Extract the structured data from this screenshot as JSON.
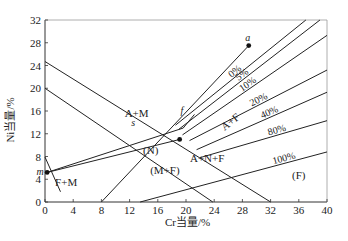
{
  "chart_data": {
    "type": "diagram",
    "title": "",
    "xlabel": "Cr当量/%",
    "ylabel": "Ni当量/%",
    "xlim": [
      0,
      40
    ],
    "ylim": [
      0,
      32
    ],
    "x_ticks": [
      "0",
      "4",
      "8",
      "12",
      "16",
      "20",
      "24",
      "28",
      "32",
      "36",
      "40"
    ],
    "y_ticks": [
      "0",
      "4",
      "8",
      "12",
      "16",
      "20",
      "24",
      "28",
      "32"
    ],
    "grid": false,
    "regions": [
      {
        "label": "A+M",
        "x": 13,
        "y": 15
      },
      {
        "label": "A",
        "x": 20.6,
        "y": 13.6
      },
      {
        "label": "A+F",
        "x": 26.6,
        "y": 13.6
      },
      {
        "label": "(N)",
        "x": 15,
        "y": 8.5
      },
      {
        "label": "(M+F)",
        "x": 17,
        "y": 5
      },
      {
        "label": "A+N+F",
        "x": 23,
        "y": 7
      },
      {
        "label": "F+M",
        "x": 3,
        "y": 2.8
      },
      {
        "label": "(F)",
        "x": 36,
        "y": 4
      }
    ],
    "ferrite_lines": [
      {
        "label": "0%",
        "from": [
          18.5,
          13.5
        ],
        "to": [
          37,
          32
        ]
      },
      {
        "label": "5%",
        "from": [
          19,
          12.8
        ],
        "to": [
          39,
          32
        ]
      },
      {
        "label": "10%",
        "from": [
          19.5,
          11.8
        ],
        "to": [
          40,
          29.3
        ]
      },
      {
        "label": "20%",
        "from": [
          20.5,
          10.8
        ],
        "to": [
          40,
          23.2
        ]
      },
      {
        "label": "40%",
        "from": [
          21.5,
          9.2
        ],
        "to": [
          40,
          19.3
        ]
      },
      {
        "label": "80%",
        "from": [
          22,
          7.8
        ],
        "to": [
          40,
          14.3
        ]
      },
      {
        "label": "100%",
        "from": [
          13.5,
          0
        ],
        "to": [
          40,
          8.8
        ]
      }
    ],
    "boundary_lines": [
      {
        "name": "A/A+M",
        "from": [
          0,
          24.7
        ],
        "to": [
          32,
          0
        ]
      },
      {
        "name": "M boundary",
        "from": [
          0,
          20
        ],
        "to": [
          23.8,
          0
        ]
      },
      {
        "name": "F+M boundary",
        "from": [
          0,
          7.9
        ],
        "to": [
          2.2,
          1.8
        ]
      },
      {
        "name": "a-line",
        "from": [
          8,
          0
        ],
        "to": [
          28.9,
          27.5
        ]
      }
    ],
    "tie_lines": [
      {
        "name": "m-s-f",
        "points": [
          [
            0.3,
            5.2
          ],
          [
            19.6,
            13.0
          ]
        ]
      },
      {
        "name": "m-dot",
        "points": [
          [
            0.3,
            5.2
          ],
          [
            19.1,
            11.0
          ]
        ]
      }
    ],
    "points": [
      {
        "label": "a",
        "x": 28.9,
        "y": 27.5
      },
      {
        "label": "m",
        "x": 0.3,
        "y": 5.2
      },
      {
        "label": "",
        "x": 19.1,
        "y": 11.0
      }
    ],
    "point_labels": [
      {
        "label": "f",
        "x": 19.4,
        "y": 15.5
      },
      {
        "label": "s",
        "x": 12.5,
        "y": 13.4
      }
    ]
  },
  "ui": {
    "axis_title_x": "Cr当量/%",
    "axis_title_y": "Ni当量/%"
  }
}
